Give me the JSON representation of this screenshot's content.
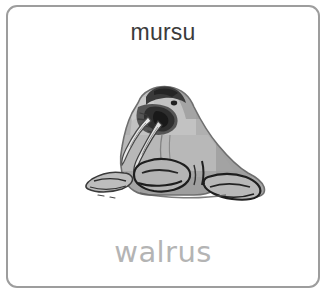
{
  "card": {
    "border_color": "#9d9d9d",
    "background_color": "#ffffff",
    "corner_radius_px": 11
  },
  "vocabulary": {
    "source_word": "mursu",
    "source_word_color": "#3b3b3b",
    "translated_word": "walrus",
    "translated_word_color": "#b4b4b4"
  },
  "illustration": {
    "subject": "walrus",
    "alt_text": "walrus",
    "style": "grayscale drawing",
    "orientation": "facing left",
    "colors": {
      "body_light": "#c4c4c4",
      "body_mid": "#a8a8a8",
      "body_shadow": "#8e8e8e",
      "outline_dark": "#2b2b2b",
      "tusk_light": "#e6e6e6"
    }
  }
}
